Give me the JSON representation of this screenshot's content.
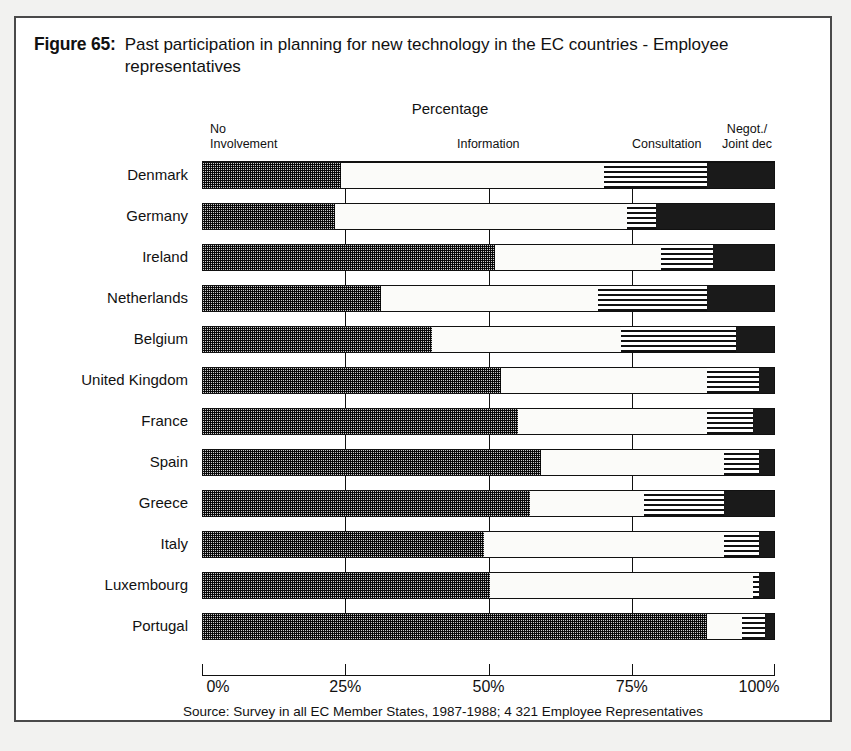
{
  "figure": {
    "number": "Figure 65:",
    "title": "Past participation in planning for new technology in the EC countries - Employee representatives",
    "percentage_caption": "Percentage",
    "source": "Source: Survey in all EC Member States, 1987-1988; 4 321 Employee Representatives"
  },
  "segment_headers": [
    {
      "line1": "No",
      "line2": "Involvement"
    },
    {
      "line1": "",
      "line2": "Information"
    },
    {
      "line1": "",
      "line2": "Consultation"
    },
    {
      "line1": "Negot./",
      "line2": "Joint dec"
    }
  ],
  "colors": {
    "no_involvement": "#cccccc",
    "information": "#fbfbf9",
    "consultation": "#ffffff",
    "negotiation": "#1a1a1a",
    "outline": "#111111",
    "page_background": "#f2f2f0",
    "panel_background": "#ffffff"
  },
  "chart_data": {
    "type": "bar",
    "orientation": "horizontal",
    "stacked": true,
    "normalized_percent": true,
    "title": "Past participation in planning for new technology in the EC countries - Employee representatives",
    "subtitle": "Percentage",
    "xlabel": "",
    "ylabel": "",
    "xlim": [
      0,
      100
    ],
    "xticks": [
      0,
      25,
      50,
      75,
      100
    ],
    "xticklabels": [
      "0%",
      "25%",
      "50%",
      "75%",
      "100%"
    ],
    "grid": true,
    "legend_position": "top",
    "categories": [
      "Denmark",
      "Germany",
      "Ireland",
      "Netherlands",
      "Belgium",
      "United Kingdom",
      "France",
      "Spain",
      "Greece",
      "Italy",
      "Luxembourg",
      "Portugal"
    ],
    "series": [
      {
        "name": "No Involvement",
        "values": [
          24,
          23,
          51,
          31,
          40,
          52,
          55,
          59,
          57,
          49,
          50,
          88
        ]
      },
      {
        "name": "Information",
        "values": [
          46,
          51,
          29,
          38,
          33,
          36,
          33,
          32,
          20,
          42,
          46,
          6
        ]
      },
      {
        "name": "Consultation",
        "values": [
          18,
          5,
          9,
          19,
          20,
          9,
          8,
          6,
          14,
          6,
          1,
          4
        ]
      },
      {
        "name": "Negot./Joint dec",
        "values": [
          12,
          21,
          11,
          12,
          7,
          3,
          4,
          3,
          9,
          3,
          3,
          2
        ]
      }
    ],
    "rows": [
      {
        "country": "Denmark",
        "stops": [
          0,
          24,
          70,
          88,
          100
        ]
      },
      {
        "country": "Germany",
        "stops": [
          0,
          23,
          74,
          79,
          100
        ]
      },
      {
        "country": "Ireland",
        "stops": [
          0,
          51,
          80,
          89,
          100
        ]
      },
      {
        "country": "Netherlands",
        "stops": [
          0,
          31,
          69,
          88,
          100
        ]
      },
      {
        "country": "Belgium",
        "stops": [
          0,
          40,
          73,
          93,
          100
        ]
      },
      {
        "country": "United Kingdom",
        "stops": [
          0,
          52,
          88,
          97,
          100
        ]
      },
      {
        "country": "France",
        "stops": [
          0,
          55,
          88,
          96,
          100
        ]
      },
      {
        "country": "Spain",
        "stops": [
          0,
          59,
          91,
          97,
          100
        ]
      },
      {
        "country": "Greece",
        "stops": [
          0,
          57,
          77,
          91,
          100
        ]
      },
      {
        "country": "Italy",
        "stops": [
          0,
          49,
          91,
          97,
          100
        ]
      },
      {
        "country": "Luxembourg",
        "stops": [
          0,
          50,
          96,
          97,
          100
        ]
      },
      {
        "country": "Portugal",
        "stops": [
          0,
          88,
          94,
          98,
          100
        ]
      }
    ]
  }
}
